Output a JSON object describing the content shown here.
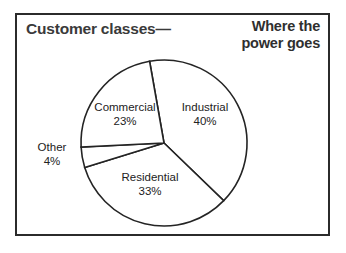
{
  "figure": {
    "title_left": "Customer classes—",
    "title_right_line1": "Where the",
    "title_right_line2": "power goes",
    "frame_color": "#2b2b2b",
    "line_color": "#242424",
    "background_color": "#ffffff"
  },
  "chart_data": {
    "type": "pie",
    "title": "Customer classes— Where the power goes",
    "unit": "%",
    "categories": [
      "Industrial",
      "Residential",
      "Other",
      "Commercial"
    ],
    "values": [
      40,
      33,
      4,
      23
    ],
    "labels": [
      {
        "name": "Commercial",
        "pct": "23%",
        "value": 23
      },
      {
        "name": "Industrial",
        "pct": "40%",
        "value": 40
      },
      {
        "name": "Residential",
        "pct": "33%",
        "value": 33
      },
      {
        "name": "Other",
        "pct": "4%",
        "value": 4
      }
    ],
    "legend": "none",
    "start_angle_deg": -10,
    "direction": "clockwise",
    "slice_fill": "#ffffff",
    "slice_stroke": "#242424"
  }
}
